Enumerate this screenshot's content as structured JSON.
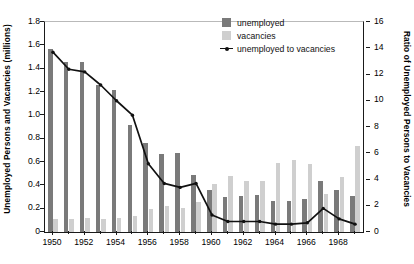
{
  "chart_data": {
    "type": "bar",
    "title": "",
    "subtitle": "",
    "xlabel": "",
    "ylabel": "Unemployed Persons and Vacancies (millions)",
    "ylabel_secondary": "Ratio of Unemployed Persons to Vacancies",
    "categories": [
      "1950",
      "1951",
      "1952",
      "1953",
      "1954",
      "1955",
      "1956",
      "1957",
      "1958",
      "1959",
      "1960",
      "1961",
      "1962",
      "1963",
      "1964",
      "1965",
      "1966",
      "1967",
      "1968",
      "1969"
    ],
    "xtick_labels": [
      "1950",
      "1952",
      "1954",
      "1956",
      "1958",
      "1960",
      "1962",
      "1964",
      "1966",
      "1968"
    ],
    "xtick_categories": [
      "1950",
      "1952",
      "1954",
      "1956",
      "1958",
      "1960",
      "1962",
      "1964",
      "1966",
      "1968"
    ],
    "ylim": [
      0,
      1.8
    ],
    "yticks": [
      0,
      0.2,
      0.4,
      0.6,
      0.8,
      1.0,
      1.2,
      1.4,
      1.6,
      1.8
    ],
    "ytick_labels": [
      "0",
      "0.2",
      "0.4",
      "0.6",
      "0.8",
      "1.0",
      "1.2",
      "1.4",
      "1.6",
      "1.8"
    ],
    "ylim_secondary": [
      0,
      16
    ],
    "yticks_secondary": [
      0,
      2,
      4,
      6,
      8,
      10,
      12,
      14,
      16
    ],
    "ytick_labels_secondary": [
      "0",
      "2",
      "4",
      "6",
      "8",
      "10",
      "12",
      "14",
      "16"
    ],
    "grid": false,
    "legend_position": "top-right",
    "series": [
      {
        "name": "unemployed",
        "type": "bar",
        "axis": "left",
        "color": "#7a7a7a",
        "values": [
          1.57,
          1.46,
          1.46,
          1.26,
          1.22,
          0.92,
          0.76,
          0.67,
          0.68,
          0.49,
          0.36,
          0.3,
          0.31,
          0.32,
          0.27,
          0.27,
          0.28,
          0.44,
          0.36,
          0.31
        ]
      },
      {
        "name": "vacancies",
        "type": "bar",
        "axis": "left",
        "color": "#cfcfcf",
        "values": [
          0.11,
          0.11,
          0.12,
          0.11,
          0.12,
          0.14,
          0.2,
          0.22,
          0.21,
          0.26,
          0.41,
          0.48,
          0.44,
          0.44,
          0.59,
          0.62,
          0.58,
          0.33,
          0.47,
          0.74
        ]
      },
      {
        "name": "unemployed to vacancies",
        "type": "line",
        "axis": "right",
        "color": "#111111",
        "marker": "dot",
        "values": [
          13.7,
          12.4,
          12.2,
          11.2,
          10.0,
          8.9,
          5.2,
          3.7,
          3.4,
          3.7,
          1.3,
          0.8,
          0.8,
          0.8,
          0.6,
          0.6,
          0.7,
          1.8,
          1.0,
          0.6
        ]
      }
    ]
  },
  "legend": {
    "items": [
      {
        "label": "unemployed",
        "marker": "swatch-dark"
      },
      {
        "label": "vacancies",
        "marker": "swatch-light"
      },
      {
        "label": "unemployed to vacancies",
        "marker": "line-dot"
      }
    ]
  }
}
